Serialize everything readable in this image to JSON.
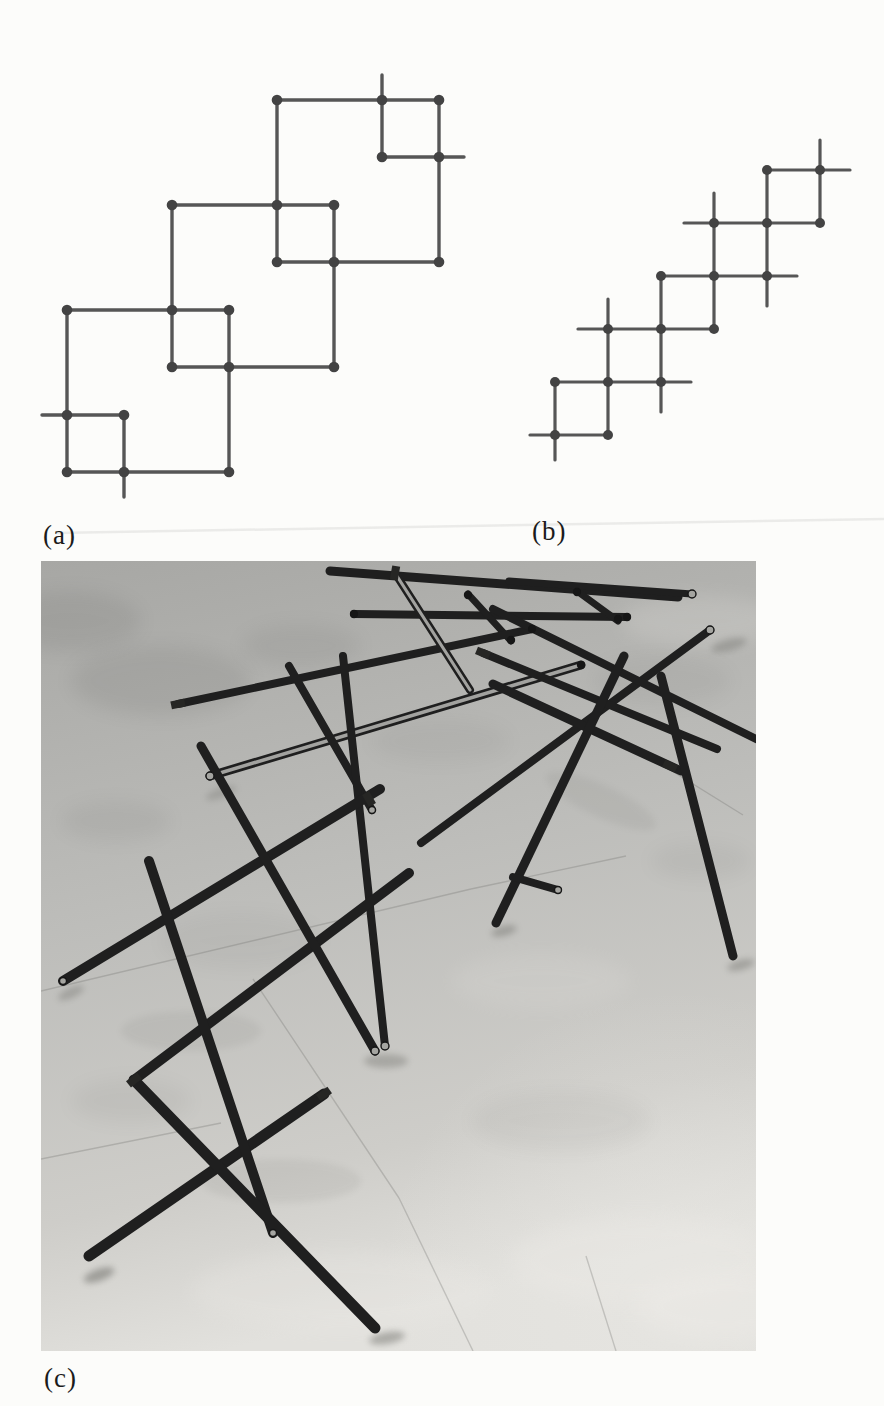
{
  "figure": {
    "sublabels": {
      "a": "(a)",
      "b": "(b)",
      "c": "(c)"
    },
    "diagram_line_color": "#565656",
    "diagram_dot_color": "#434343",
    "diagram_a": {
      "stroke_width": 3.4,
      "dot_radius": 5.3,
      "segments": [
        [
          277,
          100,
          439,
          100
        ],
        [
          382,
          157,
          464,
          157
        ],
        [
          172,
          205,
          334,
          205
        ],
        [
          277,
          262,
          439,
          262
        ],
        [
          67,
          310,
          229,
          310
        ],
        [
          172,
          367,
          334,
          367
        ],
        [
          42,
          415,
          124,
          415
        ],
        [
          67,
          472,
          229,
          472
        ],
        [
          382,
          75,
          382,
          157
        ],
        [
          277,
          100,
          277,
          262
        ],
        [
          439,
          100,
          439,
          262
        ],
        [
          172,
          205,
          172,
          367
        ],
        [
          334,
          205,
          334,
          367
        ],
        [
          67,
          310,
          67,
          472
        ],
        [
          229,
          310,
          229,
          472
        ],
        [
          124,
          415,
          124,
          497
        ]
      ],
      "dots": [
        [
          67,
          310
        ],
        [
          229,
          310
        ],
        [
          67,
          472
        ],
        [
          229,
          472
        ],
        [
          172,
          205
        ],
        [
          334,
          205
        ],
        [
          172,
          367
        ],
        [
          334,
          367
        ],
        [
          277,
          100
        ],
        [
          439,
          100
        ],
        [
          277,
          262
        ],
        [
          439,
          262
        ],
        [
          172,
          310
        ],
        [
          229,
          367
        ],
        [
          277,
          205
        ],
        [
          334,
          262
        ],
        [
          67,
          415
        ],
        [
          124,
          415
        ],
        [
          124,
          472
        ],
        [
          382,
          100
        ],
        [
          382,
          157
        ],
        [
          439,
          157
        ]
      ]
    },
    "diagram_b": {
      "stroke_width": 3.2,
      "dot_radius": 5.0,
      "segments": [
        [
          530,
          435,
          608,
          435
        ],
        [
          555,
          382,
          691,
          382
        ],
        [
          578,
          329,
          714,
          329
        ],
        [
          661,
          276,
          797,
          276
        ],
        [
          684,
          223,
          820,
          223
        ],
        [
          767,
          170,
          850,
          170
        ],
        [
          555,
          382,
          555,
          460
        ],
        [
          608,
          299,
          608,
          435
        ],
        [
          661,
          276,
          661,
          412
        ],
        [
          714,
          193,
          714,
          329
        ],
        [
          767,
          170,
          767,
          306
        ],
        [
          820,
          140,
          820,
          223
        ]
      ],
      "dots": [
        [
          555,
          382
        ],
        [
          555,
          435
        ],
        [
          608,
          329
        ],
        [
          608,
          382
        ],
        [
          608,
          435
        ],
        [
          661,
          276
        ],
        [
          661,
          329
        ],
        [
          661,
          382
        ],
        [
          714,
          223
        ],
        [
          714,
          276
        ],
        [
          714,
          329
        ],
        [
          767,
          170
        ],
        [
          767,
          223
        ],
        [
          767,
          276
        ],
        [
          820,
          170
        ],
        [
          820,
          223
        ]
      ]
    },
    "scan_band": [
      55,
      533,
      884,
      519
    ],
    "photo": {
      "left": 41,
      "top": 561,
      "width": 715,
      "height": 790,
      "floor_colors": {
        "far": "#a7a7a4",
        "mid": "#bdbdba",
        "near": "#cecdc9",
        "light_corner": "#e2e1dd"
      },
      "rod_color": "#1f1f1f",
      "shine_color": "#b9b9b6",
      "shadow_color": "#5c5c57",
      "joint_line_color": "#6f6f6c",
      "rods": [
        [
          289,
          10,
          637,
          36,
          9,
          0
        ],
        [
          468,
          20,
          651,
          33,
          7,
          0
        ],
        [
          313,
          53,
          586,
          56,
          8,
          0
        ],
        [
          427,
          33,
          470,
          80,
          7,
          0
        ],
        [
          536,
          30,
          577,
          60,
          7,
          0
        ],
        [
          137,
          143,
          491,
          68,
          8,
          0
        ],
        [
          169,
          215,
          540,
          104,
          9,
          1
        ],
        [
          354,
          12,
          429,
          129,
          8,
          1
        ],
        [
          248,
          105,
          331,
          249,
          8,
          0
        ],
        [
          302,
          95,
          344,
          485,
          8,
          0
        ],
        [
          339,
          228,
          22,
          420,
          10,
          0
        ],
        [
          368,
          312,
          93,
          519,
          10,
          0
        ],
        [
          283,
          533,
          48,
          695,
          11,
          0
        ],
        [
          160,
          185,
          334,
          490,
          9,
          0
        ],
        [
          108,
          300,
          232,
          672,
          10,
          0
        ],
        [
          93,
          519,
          334,
          767,
          11,
          0
        ],
        [
          380,
          282,
          669,
          69,
          8,
          0
        ],
        [
          452,
          48,
          715,
          178,
          8,
          0
        ],
        [
          442,
          92,
          676,
          188,
          8,
          0
        ],
        [
          452,
          123,
          640,
          210,
          9,
          0
        ],
        [
          583,
          95,
          455,
          362,
          9,
          0
        ],
        [
          620,
          115,
          692,
          395,
          9,
          0
        ],
        [
          472,
          316,
          517,
          329,
          8,
          0
        ]
      ],
      "end_caps": [
        [
          669,
          69,
          4
        ],
        [
          334,
          490,
          4
        ],
        [
          344,
          485,
          4
        ],
        [
          331,
          249,
          3.5
        ],
        [
          169,
          215,
          4
        ],
        [
          232,
          672,
          3.5
        ],
        [
          517,
          329,
          3.5
        ],
        [
          22,
          420,
          3.5
        ],
        [
          651,
          33,
          4
        ]
      ],
      "tabs": [
        [
          629,
          205,
          25
        ],
        [
          328,
          238,
          60
        ],
        [
          93,
          519,
          -38
        ],
        [
          137,
          143,
          -12
        ],
        [
          442,
          92,
          22
        ],
        [
          283,
          533,
          -35
        ],
        [
          354,
          12,
          -80
        ]
      ],
      "cluster_joints": [
        [
          427,
          34
        ],
        [
          470,
          79
        ],
        [
          536,
          31
        ],
        [
          577,
          58
        ],
        [
          586,
          56
        ],
        [
          313,
          53
        ],
        [
          491,
          68
        ],
        [
          540,
          104
        ]
      ],
      "shadows": [
        [
          58,
          714,
          16,
          6,
          -20,
          0.45
        ],
        [
          346,
          777,
          18,
          6,
          -10,
          0.4
        ],
        [
          463,
          370,
          13,
          5,
          -15,
          0.35
        ],
        [
          700,
          404,
          14,
          5,
          -15,
          0.35
        ],
        [
          345,
          500,
          22,
          7,
          0,
          0.3
        ],
        [
          688,
          84,
          18,
          6,
          -15,
          0.3
        ],
        [
          180,
          232,
          16,
          5,
          -20,
          0.25
        ],
        [
          30,
          432,
          14,
          5,
          -25,
          0.3
        ],
        [
          150,
          470,
          70,
          20,
          0,
          0.08
        ],
        [
          240,
          620,
          80,
          22,
          0,
          0.08
        ],
        [
          560,
          240,
          60,
          16,
          25,
          0.08
        ]
      ],
      "tile_joints": [
        [
          0,
          430,
          430,
          328
        ],
        [
          212,
          418,
          358,
          637
        ],
        [
          358,
          637,
          432,
          790
        ],
        [
          545,
          695,
          575,
          790
        ],
        [
          594,
          187,
          702,
          254
        ],
        [
          0,
          598,
          180,
          562
        ],
        [
          430,
          328,
          585,
          295
        ]
      ],
      "blotches_dark": [
        [
          120,
          120,
          90,
          35,
          0.1
        ],
        [
          260,
          85,
          60,
          22,
          0.08
        ],
        [
          75,
          260,
          55,
          20,
          0.07
        ],
        [
          620,
          120,
          70,
          25,
          0.06
        ],
        [
          200,
          380,
          80,
          28,
          0.05
        ],
        [
          520,
          560,
          90,
          30,
          0.05
        ],
        [
          660,
          300,
          50,
          18,
          0.06
        ],
        [
          90,
          540,
          60,
          22,
          0.06
        ],
        [
          400,
          180,
          70,
          22,
          0.05
        ],
        [
          30,
          60,
          70,
          30,
          0.1
        ]
      ],
      "patches_light": [
        [
          600,
          700,
          130,
          45,
          0.35
        ],
        [
          685,
          745,
          90,
          35,
          0.5
        ],
        [
          300,
          730,
          150,
          40,
          0.25
        ],
        [
          660,
          60,
          80,
          25,
          0.18
        ],
        [
          500,
          420,
          90,
          28,
          0.12
        ]
      ]
    }
  }
}
